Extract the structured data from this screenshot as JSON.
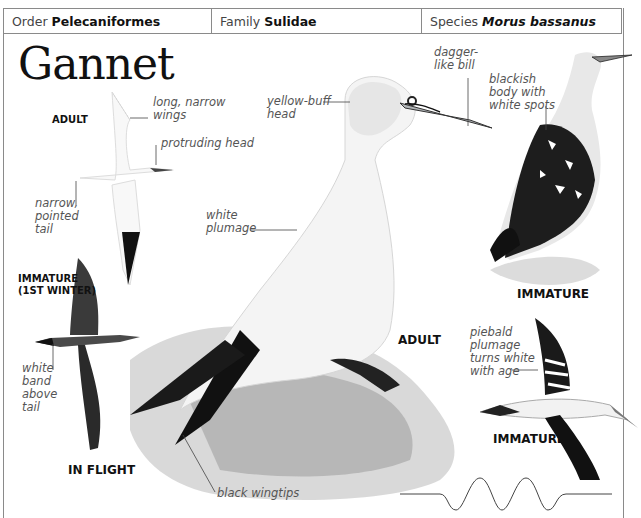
{
  "header": {
    "order_label": "Order",
    "order_value": "Pelecaniformes",
    "family_label": "Family",
    "family_value": "Sulidae",
    "species_label": "Species",
    "species_value": "Morus bassanus"
  },
  "title": "Gannet",
  "captions": {
    "adult_flight": "ADULT",
    "immature_flight_1": "IMMATURE",
    "immature_flight_2": "(1ST WINTER)",
    "in_flight": "IN FLIGHT",
    "adult_main": "ADULT",
    "immature_standing": "IMMATURE",
    "immature_flying": "IMMATURE"
  },
  "annotations": {
    "long_narrow_wings": [
      "long, narrow",
      "wings"
    ],
    "protruding_head": [
      "protruding head"
    ],
    "narrow_pointed_tail": [
      "narrow,",
      "pointed",
      "tail"
    ],
    "white_band": [
      "white",
      "band",
      "above",
      "tail"
    ],
    "yellow_buff_head": [
      "yellow-buff",
      "head"
    ],
    "white_plumage": [
      "white",
      "plumage"
    ],
    "dagger_bill": [
      "dagger-",
      "like bill"
    ],
    "blackish_body": [
      "blackish",
      "body with",
      "white spots"
    ],
    "piebald": [
      "piebald",
      "plumage",
      "turns white",
      "with age"
    ],
    "black_wingtips": [
      "black wingtips"
    ]
  },
  "colors": {
    "border": "#8a8a8a",
    "ink": "#111111",
    "label": "#555555"
  },
  "flight_pattern": {
    "type": "undulating",
    "icon": "flight-path-wave"
  }
}
